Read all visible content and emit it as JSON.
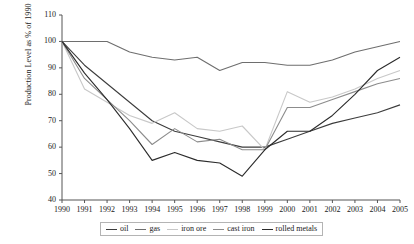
{
  "chart_data": {
    "type": "line",
    "title": "",
    "xlabel": "",
    "ylabel": "Production Level as % of 1990",
    "x": [
      1990,
      1991,
      1992,
      1993,
      1994,
      1995,
      1996,
      1997,
      1998,
      1999,
      2000,
      2001,
      2002,
      2003,
      2004,
      2005
    ],
    "categories": [
      "1990",
      "1991",
      "1992",
      "1993",
      "1994",
      "1995",
      "1996",
      "1997",
      "1998",
      "1999",
      "2000",
      "2001",
      "2002",
      "2003",
      "2004",
      "2005"
    ],
    "xlim": [
      1990,
      2005
    ],
    "ylim": [
      40,
      110
    ],
    "yticks": [
      40,
      50,
      60,
      70,
      80,
      90,
      100,
      110
    ],
    "grid": false,
    "legend_position": "bottom",
    "series": [
      {
        "name": "oil",
        "color": "#3c3c3c",
        "values": [
          100,
          91,
          84,
          77,
          70,
          66,
          64,
          62,
          60,
          60,
          63,
          66,
          69,
          71,
          73,
          76
        ]
      },
      {
        "name": "gas",
        "color": "#6e6e6e",
        "values": [
          100,
          100,
          100,
          96,
          94,
          93,
          94,
          89,
          92,
          92,
          91,
          91,
          93,
          96,
          98,
          100
        ]
      },
      {
        "name": "iron ore",
        "color": "#c8c8c8",
        "values": [
          100,
          82,
          77,
          72,
          69,
          73,
          67,
          66,
          68,
          59,
          81,
          77,
          79,
          82,
          86,
          89
        ]
      },
      {
        "name": "cast iron",
        "color": "#8c8c8c",
        "values": [
          100,
          86,
          78,
          70,
          61,
          67,
          62,
          63,
          59,
          59,
          75,
          75,
          78,
          81,
          84,
          86
        ]
      },
      {
        "name": "rolled metals",
        "color": "#2b2b2b",
        "values": [
          100,
          88,
          78,
          67,
          55,
          58,
          55,
          54,
          49,
          59,
          66,
          66,
          72,
          80,
          89,
          94
        ]
      }
    ]
  },
  "axes": {
    "ytick_labels": [
      "110",
      "100",
      "90",
      "80",
      "70",
      "60",
      "50",
      "40"
    ],
    "xtick_labels": [
      "1990",
      "1991",
      "1992",
      "1993",
      "1994",
      "1995",
      "1996",
      "1997",
      "1998",
      "1999",
      "2000",
      "2001",
      "2002",
      "2003",
      "2004",
      "2005"
    ]
  },
  "legend": {
    "items": [
      {
        "label": "oil"
      },
      {
        "label": "gas"
      },
      {
        "label": "iron ore"
      },
      {
        "label": "cast iron"
      },
      {
        "label": "rolled metals"
      }
    ]
  },
  "colors": {
    "axis": "#555555",
    "legend_border": "#b4b4b4",
    "background": "#ffffff"
  }
}
